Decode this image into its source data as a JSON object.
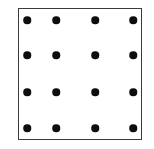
{
  "figure": {
    "type": "dot-grid-diagram",
    "background_color": "#ffffff",
    "frame": {
      "shape": "square",
      "x": 18,
      "y": 8,
      "width": 124,
      "height": 132,
      "border_color": "#3a3a3a",
      "border_width": 1.5,
      "fill_color": "#ffffff"
    },
    "grid": {
      "rows": 4,
      "columns": 4,
      "total_dots": 16,
      "dot_color": "#0d0d0d",
      "dot_diameter": 7.5,
      "column_centers_x": [
        27,
        56,
        95,
        133
      ],
      "row_centers_y": [
        20,
        55,
        92,
        128
      ]
    },
    "dots": [
      {
        "row": 1,
        "col": 1,
        "cx": 27,
        "cy": 20,
        "r": 3.75
      },
      {
        "row": 1,
        "col": 2,
        "cx": 56,
        "cy": 20,
        "r": 3.75
      },
      {
        "row": 1,
        "col": 3,
        "cx": 95,
        "cy": 20,
        "r": 3.75
      },
      {
        "row": 1,
        "col": 4,
        "cx": 133,
        "cy": 20,
        "r": 3.75
      },
      {
        "row": 2,
        "col": 1,
        "cx": 27,
        "cy": 55,
        "r": 3.75
      },
      {
        "row": 2,
        "col": 2,
        "cx": 56,
        "cy": 55,
        "r": 3.75
      },
      {
        "row": 2,
        "col": 3,
        "cx": 95,
        "cy": 55,
        "r": 3.75
      },
      {
        "row": 2,
        "col": 4,
        "cx": 133,
        "cy": 55,
        "r": 3.75
      },
      {
        "row": 3,
        "col": 1,
        "cx": 27,
        "cy": 92,
        "r": 3.75
      },
      {
        "row": 3,
        "col": 2,
        "cx": 56,
        "cy": 92,
        "r": 3.75
      },
      {
        "row": 3,
        "col": 3,
        "cx": 95,
        "cy": 92,
        "r": 3.75
      },
      {
        "row": 3,
        "col": 4,
        "cx": 133,
        "cy": 92,
        "r": 3.75
      },
      {
        "row": 4,
        "col": 1,
        "cx": 27,
        "cy": 128,
        "r": 3.75
      },
      {
        "row": 4,
        "col": 2,
        "cx": 56,
        "cy": 128,
        "r": 3.75
      },
      {
        "row": 4,
        "col": 3,
        "cx": 95,
        "cy": 128,
        "r": 3.75
      },
      {
        "row": 4,
        "col": 4,
        "cx": 133,
        "cy": 128,
        "r": 3.75
      }
    ],
    "labels": []
  }
}
